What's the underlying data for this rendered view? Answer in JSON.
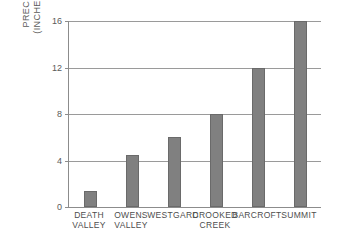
{
  "chart_data": {
    "type": "bar",
    "title": "",
    "subtitle": "",
    "xlabel": "",
    "ylabel": "PRECIPITATION (INCHES OF RAIN)",
    "ylabel_lines": [
      "PRECIPITATION",
      "(INCHES OF RAIN)"
    ],
    "categories": [
      "DEATH VALLEY",
      "OWENS VALLEY",
      "WESTGARD",
      "CROOKED CREEK",
      "BARCROFT",
      "SUMMIT"
    ],
    "category_lines": [
      [
        "DEATH",
        "VALLEY"
      ],
      [
        "OWENS",
        "VALLEY"
      ],
      [
        "WESTGARD",
        ""
      ],
      [
        "CROOKED",
        "CREEK"
      ],
      [
        "BARCROFT",
        ""
      ],
      [
        "SUMMIT",
        ""
      ]
    ],
    "values": [
      1.4,
      4.5,
      6,
      8,
      12,
      16
    ],
    "ylim": [
      0,
      16
    ],
    "yticks": [
      0,
      4,
      8,
      12,
      16
    ],
    "ytick_labels": [
      "0",
      "4",
      "8",
      "12",
      "16"
    ],
    "grid": true,
    "legend": false,
    "legend_position": "none",
    "bar_color": "#808080",
    "bar_edge_color": "#6a6a6a",
    "axis_color": "#8c8c8c",
    "grid_color": "#9a9a9a",
    "background_color": "#ffffff",
    "text_color": "#4d4d4d"
  }
}
